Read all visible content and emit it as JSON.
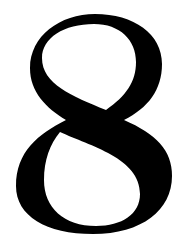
{
  "glyph": {
    "character": "8",
    "color": "#000000",
    "background": "#ffffff"
  }
}
